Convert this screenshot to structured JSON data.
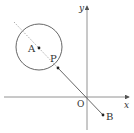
{
  "diagram": {
    "type": "coordinate-geometry",
    "axes": {
      "x_label": "x",
      "y_label": "y",
      "origin_label": "O",
      "origin_px": [
        87,
        97
      ]
    },
    "circle": {
      "center_label": "A",
      "center_px": [
        39,
        47
      ],
      "radius_px": 23
    },
    "points": {
      "A": {
        "label": "A",
        "px": [
          39,
          48
        ]
      },
      "P": {
        "label": "P",
        "px": [
          58,
          68
        ]
      },
      "B": {
        "label": "B",
        "px": [
          103,
          115
        ]
      }
    },
    "segments": [
      {
        "from": "A",
        "to": "P",
        "style": "dashed"
      },
      {
        "from": "P",
        "to": "B",
        "style": "solid"
      }
    ],
    "colors": {
      "stroke": "#555555",
      "text": "#333333",
      "background": "#ffffff"
    }
  }
}
